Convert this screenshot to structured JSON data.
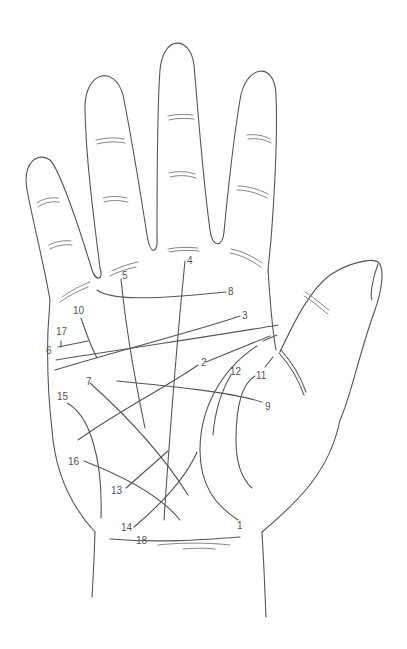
{
  "diagram": {
    "type": "palmistry-hand-lines",
    "stroke_color": "#555555",
    "background": "#ffffff",
    "labels": [
      {
        "id": "1",
        "text": "1",
        "x": 237,
        "y": 521
      },
      {
        "id": "2",
        "text": "2",
        "x": 201,
        "y": 358
      },
      {
        "id": "3",
        "text": "3",
        "x": 242,
        "y": 312
      },
      {
        "id": "4",
        "text": "4",
        "x": 187,
        "y": 257
      },
      {
        "id": "5",
        "text": "5",
        "x": 122,
        "y": 272
      },
      {
        "id": "6",
        "text": "6",
        "x": 46,
        "y": 347
      },
      {
        "id": "7",
        "text": "7",
        "x": 86,
        "y": 378
      },
      {
        "id": "8",
        "text": "8",
        "x": 228,
        "y": 288
      },
      {
        "id": "9",
        "text": "9",
        "x": 265,
        "y": 402
      },
      {
        "id": "10",
        "text": "10",
        "x": 73,
        "y": 310
      },
      {
        "id": "11",
        "text": "11",
        "x": 256,
        "y": 372
      },
      {
        "id": "12",
        "text": "12",
        "x": 230,
        "y": 367
      },
      {
        "id": "13",
        "text": "13",
        "x": 111,
        "y": 486
      },
      {
        "id": "14",
        "text": "14",
        "x": 121,
        "y": 524
      },
      {
        "id": "15",
        "text": "15",
        "x": 57,
        "y": 392
      },
      {
        "id": "16",
        "text": "16",
        "x": 68,
        "y": 457
      },
      {
        "id": "17",
        "text": "17",
        "x": 56,
        "y": 328
      },
      {
        "id": "18",
        "text": "18",
        "x": 136,
        "y": 537
      }
    ]
  }
}
